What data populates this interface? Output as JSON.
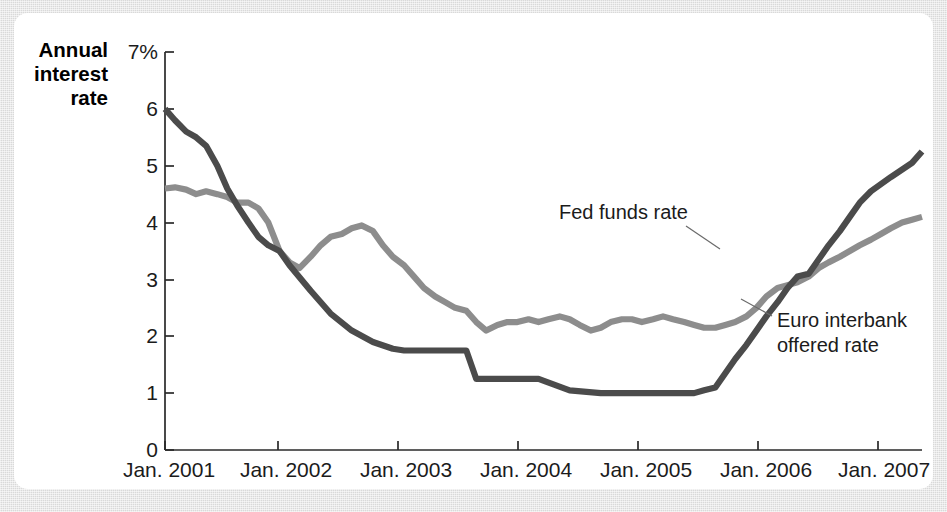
{
  "chart_data": {
    "type": "line",
    "title": "",
    "ylabel": "Annual interest rate",
    "xlabel": "",
    "ylim": [
      0,
      7
    ],
    "y_unit": "%",
    "y_ticks": [
      "0",
      "1",
      "2",
      "3",
      "4",
      "5",
      "6",
      "7%"
    ],
    "y_tick_values": [
      0,
      1,
      2,
      3,
      4,
      5,
      6,
      7
    ],
    "x_ticks": [
      "Jan. 2001",
      "Jan. 2002",
      "Jan. 2003",
      "Jan. 2004",
      "Jan. 2005",
      "Jan. 2006",
      "Jan. 2007"
    ],
    "x_tick_values": [
      2001,
      2002,
      2003,
      2004,
      2005,
      2006,
      2007
    ],
    "xlim": [
      2001,
      2007.08
    ],
    "grid": false,
    "legend_position": "inline-annotation",
    "series": [
      {
        "name": "Fed funds rate",
        "color": "#4b4b4b",
        "annotation_label": "Fed funds rate",
        "x": [
          2001.0,
          2001.08,
          2001.17,
          2001.25,
          2001.33,
          2001.42,
          2001.5,
          2001.58,
          2001.67,
          2001.75,
          2001.83,
          2001.92,
          2002.0,
          2002.17,
          2002.33,
          2002.5,
          2002.67,
          2002.83,
          2002.92,
          2003.0,
          2003.08,
          2003.17,
          2003.25,
          2003.33,
          2003.42,
          2003.5,
          2003.58,
          2003.67,
          2003.83,
          2004.0,
          2004.25,
          2004.5,
          2004.58,
          2004.67,
          2004.75,
          2004.83,
          2004.92,
          2005.0,
          2005.08,
          2005.17,
          2005.25,
          2005.33,
          2005.42,
          2005.5,
          2005.58,
          2005.67,
          2005.75,
          2005.83,
          2005.92,
          2006.0,
          2006.08,
          2006.17,
          2006.25,
          2006.33,
          2006.42,
          2006.5,
          2006.58,
          2006.67,
          2006.83,
          2007.0,
          2007.08
        ],
        "y": [
          6.0,
          5.8,
          5.6,
          5.5,
          5.35,
          5.0,
          4.6,
          4.3,
          4.0,
          3.75,
          3.6,
          3.5,
          3.25,
          2.8,
          2.4,
          2.1,
          1.9,
          1.78,
          1.75,
          1.75,
          1.75,
          1.75,
          1.75,
          1.75,
          1.75,
          1.25,
          1.25,
          1.25,
          1.25,
          1.25,
          1.05,
          1.0,
          1.0,
          1.0,
          1.0,
          1.0,
          1.0,
          1.0,
          1.0,
          1.0,
          1.0,
          1.05,
          1.1,
          1.35,
          1.6,
          1.85,
          2.1,
          2.35,
          2.6,
          2.85,
          3.05,
          3.1,
          3.35,
          3.6,
          3.85,
          4.1,
          4.35,
          4.55,
          4.8,
          5.05,
          5.25
        ],
        "final_value": 5.25,
        "start_value": 6.0
      },
      {
        "name": "Euro interbank offered rate",
        "color": "#8d8d8d",
        "annotation_label": "Euro interbank offered rate",
        "x": [
          2001.0,
          2001.08,
          2001.17,
          2001.25,
          2001.33,
          2001.42,
          2001.5,
          2001.58,
          2001.67,
          2001.75,
          2001.83,
          2001.92,
          2002.0,
          2002.08,
          2002.17,
          2002.25,
          2002.33,
          2002.42,
          2002.5,
          2002.58,
          2002.67,
          2002.75,
          2002.83,
          2002.92,
          2003.0,
          2003.08,
          2003.17,
          2003.25,
          2003.33,
          2003.42,
          2003.5,
          2003.58,
          2003.67,
          2003.75,
          2003.83,
          2003.92,
          2004.0,
          2004.08,
          2004.17,
          2004.25,
          2004.33,
          2004.42,
          2004.5,
          2004.58,
          2004.67,
          2004.75,
          2004.83,
          2004.92,
          2005.0,
          2005.08,
          2005.17,
          2005.25,
          2005.33,
          2005.42,
          2005.5,
          2005.58,
          2005.67,
          2005.75,
          2005.83,
          2005.92,
          2006.0,
          2006.08,
          2006.17,
          2006.25,
          2006.33,
          2006.42,
          2006.5,
          2006.58,
          2006.67,
          2006.75,
          2006.83,
          2006.92,
          2007.0,
          2007.08
        ],
        "y": [
          4.6,
          4.62,
          4.58,
          4.5,
          4.55,
          4.5,
          4.45,
          4.35,
          4.35,
          4.25,
          4.0,
          3.5,
          3.3,
          3.2,
          3.4,
          3.6,
          3.75,
          3.8,
          3.9,
          3.95,
          3.85,
          3.6,
          3.4,
          3.25,
          3.05,
          2.85,
          2.7,
          2.6,
          2.5,
          2.45,
          2.25,
          2.1,
          2.2,
          2.25,
          2.25,
          2.3,
          2.25,
          2.3,
          2.35,
          2.3,
          2.2,
          2.1,
          2.15,
          2.25,
          2.3,
          2.3,
          2.25,
          2.3,
          2.35,
          2.3,
          2.25,
          2.2,
          2.15,
          2.15,
          2.2,
          2.25,
          2.35,
          2.5,
          2.7,
          2.85,
          2.9,
          2.95,
          3.05,
          3.2,
          3.3,
          3.4,
          3.5,
          3.6,
          3.7,
          3.8,
          3.9,
          4.0,
          4.05,
          4.1
        ],
        "final_value": 4.1,
        "start_value": 4.6
      }
    ]
  },
  "colors": {
    "fed_funds": "#4b4b4b",
    "euribor": "#8d8d8d",
    "axis": "#2a2a2a",
    "card_background": "#ffffff",
    "page_background": "#d9d9d9"
  }
}
